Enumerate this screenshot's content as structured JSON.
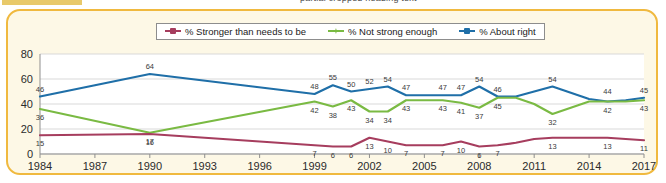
{
  "top_strip": {
    "clipped_text": "partial cropped heading text",
    "tab_color": "#e8c96a"
  },
  "card": {
    "border_color": "#f0b93f",
    "background_color": "#fdf8e6"
  },
  "legend": {
    "position": "top-center",
    "items": [
      {
        "label": "% Stronger than needs to be",
        "color": "#a63d5e",
        "marker": "square-line-marker"
      },
      {
        "label": "% Not strong enough",
        "color": "#7aba43",
        "marker": "diamond-line-marker"
      },
      {
        "label": "% About right",
        "color": "#1f6fa8",
        "marker": "square-line-marker"
      }
    ]
  },
  "chart_data": {
    "type": "line",
    "title": "",
    "subtitle": "",
    "xlabel": "",
    "ylabel": "",
    "xlim": [
      1984,
      2017
    ],
    "ylim": [
      0,
      80
    ],
    "yticks": [
      0,
      20,
      40,
      60,
      80
    ],
    "xticks": [
      1984,
      1987,
      1990,
      1993,
      1996,
      1999,
      2002,
      2005,
      2008,
      2011,
      2014,
      2017
    ],
    "grid": "horizontal",
    "legend_position": "top-center",
    "x": [
      1984,
      1990,
      1999,
      2000,
      2001,
      2002,
      2003,
      2004,
      2005,
      2006,
      2007,
      2008,
      2009,
      2010,
      2011,
      2012,
      2013,
      2014,
      2015,
      2016,
      2017
    ],
    "series": [
      {
        "name": "% About right",
        "color": "#1f6fa8",
        "values": [
          46,
          64,
          48,
          55,
          50,
          52,
          54,
          47,
          47,
          47,
          47,
          54,
          46,
          46,
          50,
          54,
          49,
          44,
          42,
          43,
          45
        ],
        "labeled_points": [
          {
            "x": 1984,
            "y": 46,
            "label": "46"
          },
          {
            "x": 1990,
            "y": 64,
            "label": "64"
          },
          {
            "x": 1999,
            "y": 48,
            "label": "48"
          },
          {
            "x": 2000,
            "y": 55,
            "label": "55"
          },
          {
            "x": 2001,
            "y": 50,
            "label": "50"
          },
          {
            "x": 2002,
            "y": 52,
            "label": "52"
          },
          {
            "x": 2003,
            "y": 54,
            "label": "54"
          },
          {
            "x": 2004,
            "y": 47,
            "label": "47"
          },
          {
            "x": 2006,
            "y": 47,
            "label": "47"
          },
          {
            "x": 2007,
            "y": 47,
            "label": "47"
          },
          {
            "x": 2008,
            "y": 54,
            "label": "54"
          },
          {
            "x": 2009,
            "y": 46,
            "label": "46"
          },
          {
            "x": 2012,
            "y": 54,
            "label": "54"
          },
          {
            "x": 2015,
            "y": 44,
            "label": "44"
          },
          {
            "x": 2017,
            "y": 45,
            "label": "45"
          }
        ]
      },
      {
        "name": "% Not strong enough",
        "color": "#7aba43",
        "values": [
          36,
          17,
          42,
          38,
          43,
          34,
          34,
          43,
          43,
          43,
          41,
          37,
          45,
          45,
          40,
          32,
          37,
          42,
          42,
          42,
          43
        ],
        "labeled_points": [
          {
            "x": 1984,
            "y": 36,
            "label": "36"
          },
          {
            "x": 1990,
            "y": 17,
            "label": "17"
          },
          {
            "x": 1999,
            "y": 42,
            "label": "42"
          },
          {
            "x": 2000,
            "y": 38,
            "label": "38"
          },
          {
            "x": 2001,
            "y": 43,
            "label": "43"
          },
          {
            "x": 2002,
            "y": 34,
            "label": "34"
          },
          {
            "x": 2003,
            "y": 34,
            "label": "34"
          },
          {
            "x": 2004,
            "y": 43,
            "label": "43"
          },
          {
            "x": 2006,
            "y": 43,
            "label": "43"
          },
          {
            "x": 2007,
            "y": 41,
            "label": "41"
          },
          {
            "x": 2008,
            "y": 37,
            "label": "37"
          },
          {
            "x": 2009,
            "y": 45,
            "label": "45"
          },
          {
            "x": 2012,
            "y": 32,
            "label": "32"
          },
          {
            "x": 2015,
            "y": 42,
            "label": "42"
          },
          {
            "x": 2017,
            "y": 43,
            "label": "43"
          }
        ]
      },
      {
        "name": "% Stronger than needs to be",
        "color": "#a63d5e",
        "values": [
          15,
          16,
          7,
          6,
          6,
          13,
          10,
          7,
          7,
          7,
          10,
          6,
          7,
          9,
          12,
          13,
          13,
          13,
          13,
          12,
          11
        ],
        "labeled_points": [
          {
            "x": 1984,
            "y": 15,
            "label": "15"
          },
          {
            "x": 1990,
            "y": 16,
            "label": "16"
          },
          {
            "x": 1999,
            "y": 7,
            "label": "7"
          },
          {
            "x": 2000,
            "y": 6,
            "label": "6"
          },
          {
            "x": 2001,
            "y": 6,
            "label": "6"
          },
          {
            "x": 2002,
            "y": 13,
            "label": "13"
          },
          {
            "x": 2003,
            "y": 10,
            "label": "10"
          },
          {
            "x": 2004,
            "y": 7,
            "label": "7"
          },
          {
            "x": 2006,
            "y": 7,
            "label": "7"
          },
          {
            "x": 2007,
            "y": 10,
            "label": "10"
          },
          {
            "x": 2008,
            "y": 6,
            "label": "6"
          },
          {
            "x": 2009,
            "y": 7,
            "label": "7"
          },
          {
            "x": 2012,
            "y": 13,
            "label": "13"
          },
          {
            "x": 2015,
            "y": 13,
            "label": "13"
          },
          {
            "x": 2017,
            "y": 11,
            "label": "11"
          }
        ]
      }
    ]
  }
}
